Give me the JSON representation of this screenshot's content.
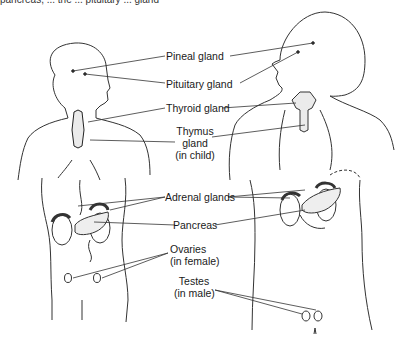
{
  "caption_fragment": "pancreas, ... the ... pituitary ... gland",
  "labels": {
    "pineal": "Pineal gland",
    "pituitary": "Pituitary gland",
    "thyroid": "Thyroid gland",
    "thymus_1": "Thymus",
    "thymus_2": "gland",
    "thymus_3": "(in child)",
    "adrenal": "Adrenal glands",
    "pancreas": "Pancreas",
    "ovaries_1": "Ovaries",
    "ovaries_2": "(in female)",
    "testes_1": "Testes",
    "testes_2": "(in male)"
  },
  "figures": [
    "female-figure",
    "male-figure"
  ],
  "colors": {
    "line": "#333333",
    "background": "#ffffff"
  }
}
